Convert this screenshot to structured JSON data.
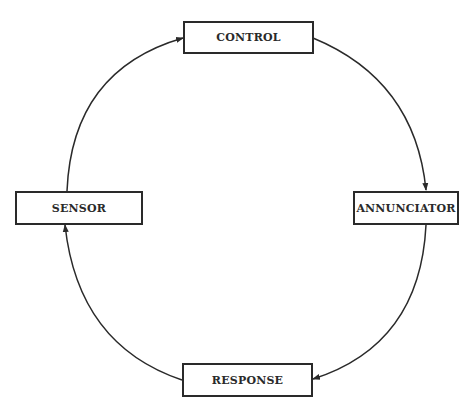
{
  "diagram": {
    "type": "cycle",
    "nodes": [
      {
        "id": "control",
        "label": "CONTROL"
      },
      {
        "id": "annunciator",
        "label": "ANNUNCIATOR"
      },
      {
        "id": "response",
        "label": "RESPONSE"
      },
      {
        "id": "sensor",
        "label": "SENSOR"
      }
    ],
    "edges": [
      {
        "from": "control",
        "to": "annunciator"
      },
      {
        "from": "annunciator",
        "to": "response"
      },
      {
        "from": "response",
        "to": "sensor"
      },
      {
        "from": "sensor",
        "to": "control"
      }
    ],
    "colors": {
      "line": "#2a2a2a",
      "background": "#ffffff"
    }
  }
}
